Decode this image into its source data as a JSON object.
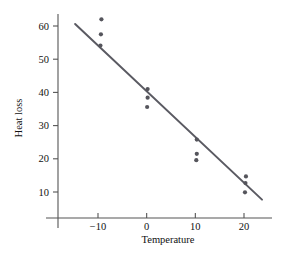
{
  "chart_data": {
    "type": "scatter",
    "title": "",
    "xlabel": "Temperature",
    "ylabel": "Heat loss",
    "xlim": [
      -18,
      25
    ],
    "ylim": [
      2,
      65
    ],
    "grid": false,
    "legend": null,
    "xticks": [
      -10,
      0,
      10,
      20
    ],
    "xtick_labels": [
      "−10",
      "0",
      "10",
      "20"
    ],
    "yticks": [
      10,
      20,
      30,
      40,
      50,
      60
    ],
    "ytick_labels": [
      "10",
      "20",
      "30",
      "40",
      "50",
      "60"
    ],
    "series": [
      {
        "name": "observations",
        "type": "scatter",
        "marker": "circle",
        "color": "#55555c",
        "points": [
          {
            "x": -9.3,
            "y": 62.0
          },
          {
            "x": -9.4,
            "y": 57.5
          },
          {
            "x": -9.5,
            "y": 54.1
          },
          {
            "x": 0.2,
            "y": 41.0
          },
          {
            "x": 0.2,
            "y": 38.4
          },
          {
            "x": 0.1,
            "y": 35.6
          },
          {
            "x": 10.3,
            "y": 25.8
          },
          {
            "x": 10.3,
            "y": 21.5
          },
          {
            "x": 10.2,
            "y": 19.6
          },
          {
            "x": 20.4,
            "y": 14.7
          },
          {
            "x": 20.3,
            "y": 12.7
          },
          {
            "x": 20.2,
            "y": 9.9
          }
        ]
      },
      {
        "name": "regression-line",
        "type": "line",
        "color": "#5a5a62",
        "x_start": -14.7,
        "y_start": 60.6,
        "x_end": 23.7,
        "y_end": 7.7
      }
    ]
  },
  "axes": {
    "x_title": "Temperature",
    "y_title": "Heat loss"
  }
}
